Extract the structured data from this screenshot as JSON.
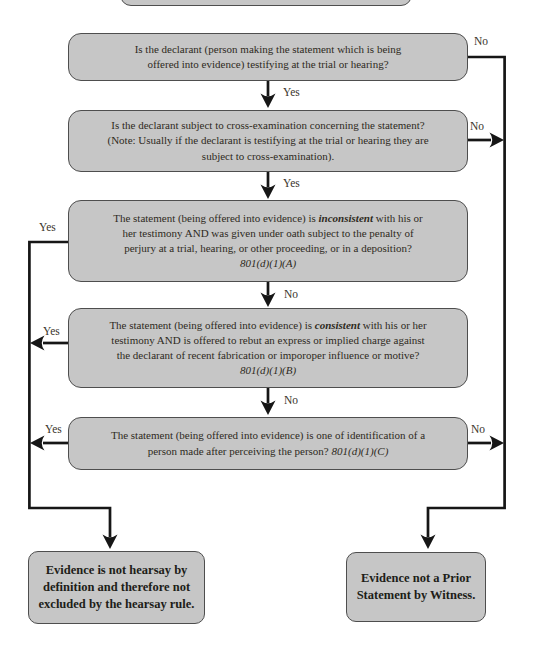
{
  "labels": {
    "yes": "Yes",
    "no": "No"
  },
  "boxes": {
    "q1": {
      "lines": [
        "Is the declarant (person making the statement which is being",
        "offered into evidence) testifying at the trial or hearing?"
      ]
    },
    "q2": {
      "lines": [
        "Is the declarant subject to cross-examination concerning the statement?",
        "(Note: Usually if the declarant is testifying at the trial or hearing they are",
        "subject to cross-examination)."
      ]
    },
    "q3": {
      "line1_pre": "The statement (being offered into evidence) is ",
      "line1_emph": "inconsistent",
      "line1_post": " with his or",
      "line2": "her testimony AND was given under oath subject to the penalty of",
      "line3": "perjury at a trial, hearing, or other proceeding, or in a deposition?",
      "citation": "801(d)(1)(A)"
    },
    "q4": {
      "line1_pre": "The statement (being offered into evidence) is ",
      "line1_emph": "consistent",
      "line1_post": " with his or her",
      "line2": "testimony AND is offered to rebut an express or implied charge against",
      "line3": "the declarant of recent fabrication or imporoper influence or motive?",
      "citation": "801(d)(1)(B)"
    },
    "q5": {
      "line1": "The statement (being offered into evidence) is one of identification of a",
      "line2_pre": "person made after perceiving the person? ",
      "line2_cite": "801(d)(1)(C)"
    },
    "end_left": {
      "lines": [
        "Evidence is not hearsay by",
        "definition and therefore not",
        "excluded by the hearsay rule."
      ]
    },
    "end_right": {
      "lines": [
        "Evidence not a Prior",
        "Statement by Witness."
      ]
    }
  },
  "colors": {
    "box_fill": "#c6c6c6",
    "box_border": "#4e4e4e",
    "line": "#161616",
    "text": "#2e2a22"
  }
}
